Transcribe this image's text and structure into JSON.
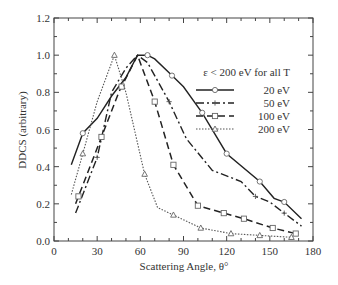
{
  "chart_data": {
    "type": "line",
    "title": "",
    "xlabel": "Scattering Angle, θ°",
    "ylabel": "DDCS (arbitrary)",
    "xlim": [
      0,
      180
    ],
    "ylim": [
      0.0,
      1.2
    ],
    "xticks": [
      0,
      30,
      60,
      90,
      120,
      150,
      180
    ],
    "xtick_labels": [
      "0",
      "30",
      "60",
      "90",
      "120",
      "150",
      "180"
    ],
    "yticks": [
      0.0,
      0.2,
      0.4,
      0.6,
      0.8,
      1.0,
      1.2
    ],
    "ytick_labels": [
      "0.0",
      "0.2",
      "0.4",
      "0.6",
      "0.8",
      "1.0",
      "1.2"
    ],
    "grid": false,
    "legend_title": "ε < 200 eV for all T",
    "legend_position": "upper right",
    "series": [
      {
        "name": "20 eV",
        "style": "solid",
        "marker": "circle",
        "x": [
          12,
          20,
          30,
          40,
          50,
          58,
          65,
          70,
          82,
          90,
          103,
          120,
          143,
          153,
          160,
          172
        ],
        "y": [
          0.41,
          0.58,
          0.66,
          0.78,
          0.88,
          1.0,
          1.0,
          0.98,
          0.89,
          0.83,
          0.69,
          0.47,
          0.32,
          0.23,
          0.21,
          0.12
        ],
        "marker_x": [
          20,
          65,
          82,
          103,
          120,
          143,
          160
        ]
      },
      {
        "name": "50 eV",
        "style": "dash-dot",
        "marker": "plus",
        "x": [
          15,
          30,
          40,
          50,
          58,
          65,
          80,
          92,
          110,
          130,
          140,
          150,
          160,
          172
        ],
        "y": [
          0.15,
          0.45,
          0.8,
          0.93,
          1.0,
          0.96,
          0.75,
          0.55,
          0.38,
          0.32,
          0.24,
          0.21,
          0.15,
          0.08
        ],
        "marker_x": [
          30,
          80,
          140,
          160
        ]
      },
      {
        "name": "100 eV",
        "style": "dashed",
        "marker": "square",
        "x": [
          15,
          30,
          45,
          58,
          70,
          83,
          100,
          118,
          132,
          152,
          168
        ],
        "y": [
          0.2,
          0.5,
          0.8,
          1.0,
          0.75,
          0.41,
          0.19,
          0.15,
          0.12,
          0.07,
          0.04
        ],
        "marker_x": [
          17,
          33,
          47,
          70,
          83,
          100,
          118,
          132,
          152,
          168
        ]
      },
      {
        "name": "200 eV",
        "style": "dotted",
        "marker": "triangle",
        "x": [
          12,
          20,
          30,
          42,
          50,
          63,
          72,
          83,
          102,
          123,
          143,
          165
        ],
        "y": [
          0.25,
          0.47,
          0.75,
          1.0,
          0.8,
          0.36,
          0.18,
          0.14,
          0.07,
          0.04,
          0.03,
          0.02
        ],
        "marker_x": [
          20,
          42,
          63,
          83,
          102,
          123,
          143,
          165
        ]
      }
    ]
  },
  "legend": {
    "title": "ε < 200 eV for all T",
    "items": [
      {
        "label": "20 eV"
      },
      {
        "label": "50 eV"
      },
      {
        "label": "100 eV"
      },
      {
        "label": "200 eV"
      }
    ]
  }
}
